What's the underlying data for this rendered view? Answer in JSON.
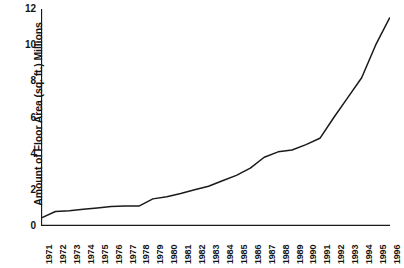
{
  "chart_data": {
    "type": "line",
    "title": "",
    "xlabel": "",
    "ylabel": "Amount of Floor Area (sq. ft.) Millions",
    "ylim": [
      0,
      12
    ],
    "yticks": [
      0,
      2,
      4,
      6,
      8,
      10,
      12
    ],
    "ytick_labels": [
      "0",
      "2",
      "4",
      "6",
      "8",
      "10",
      "12"
    ],
    "grid": false,
    "legend": "none",
    "line_color": "#1a1a1a",
    "categories": [
      "1971",
      "1972",
      "1973",
      "1974",
      "1975",
      "1976",
      "1977",
      "1978",
      "1979",
      "1980",
      "1981",
      "1982",
      "1983",
      "1984",
      "1985",
      "1986",
      "1987",
      "1988",
      "1989",
      "1990",
      "1991",
      "1992",
      "1993",
      "1994",
      "1995",
      "1996"
    ],
    "x": [
      1971,
      1972,
      1973,
      1974,
      1975,
      1976,
      1977,
      1978,
      1979,
      1980,
      1981,
      1982,
      1983,
      1984,
      1985,
      1986,
      1987,
      1988,
      1989,
      1990,
      1991,
      1992,
      1993,
      1994,
      1995,
      1996
    ],
    "values": [
      0.45,
      0.8,
      0.85,
      0.92,
      1.0,
      1.08,
      1.1,
      1.1,
      1.5,
      1.62,
      1.8,
      2.0,
      2.2,
      2.5,
      2.8,
      3.2,
      3.8,
      4.1,
      4.2,
      4.5,
      4.85,
      6.0,
      7.1,
      8.2,
      10.0,
      11.5
    ],
    "series": [
      {
        "name": "Amount of Floor Area",
        "values": [
          0.45,
          0.8,
          0.85,
          0.92,
          1.0,
          1.08,
          1.1,
          1.1,
          1.5,
          1.62,
          1.8,
          2.0,
          2.2,
          2.5,
          2.8,
          3.2,
          3.8,
          4.1,
          4.2,
          4.5,
          4.85,
          6.0,
          7.1,
          8.2,
          10.0,
          11.5
        ]
      }
    ],
    "units": "millions of square feet"
  }
}
